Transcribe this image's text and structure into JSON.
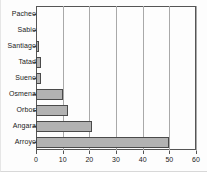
{
  "chart_data": {
    "type": "bar",
    "orientation": "horizontal",
    "title": "",
    "subtitle": "",
    "xlabel": "",
    "ylabel": "",
    "categories": [
      "Pacheo",
      "Sabio",
      "Santiago",
      "Tatad",
      "Sueno",
      "Osmena",
      "Orbos",
      "Angara",
      "Arroyo"
    ],
    "values": [
      0,
      0,
      1,
      2,
      2,
      10,
      12,
      21,
      50
    ],
    "series": [
      {
        "name": "",
        "values": [
          0,
          0,
          1,
          2,
          2,
          10,
          12,
          21,
          50
        ]
      }
    ],
    "xlim": [
      0,
      60
    ],
    "xticks": [
      0,
      10,
      20,
      30,
      40,
      50,
      60
    ],
    "xtick_labels": [
      "0",
      "10",
      "20",
      "30",
      "40",
      "50",
      "60"
    ],
    "grid": "vertical",
    "legend": "none",
    "bar_fill_color": "#b2b2b2",
    "bar_edge_color": "#4a4a4a",
    "gridline_color": "#a9a9a9",
    "axis_color": "#555555",
    "background_color": "#fdfdfd",
    "annotations": []
  }
}
